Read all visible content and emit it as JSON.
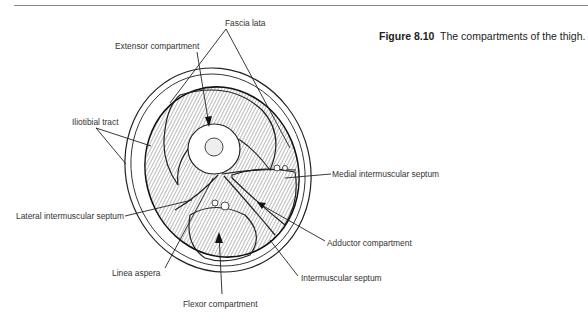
{
  "figure": {
    "number": "Figure 8.10",
    "caption": "The compartments of the thigh."
  },
  "labels": {
    "fascia_lata": "Fascia lata",
    "extensor_compartment": "Extensor compartment",
    "iliotibial_tract": "Iliotibial tract",
    "medial_intermuscular_septum": "Medial intermuscular septum",
    "lateral_intermuscular_septum": "Lateral intermuscular septum",
    "adductor_compartment": "Adductor compartment",
    "linea_aspera": "Linea aspera",
    "intermuscular_septum": "Intermuscular septum",
    "flexor_compartment": "Flexor compartment"
  }
}
